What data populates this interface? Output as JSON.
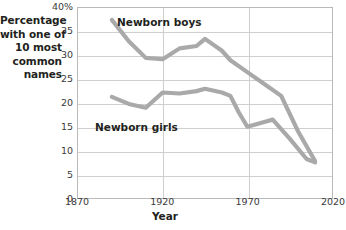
{
  "chart_data": {
    "type": "line",
    "title": "",
    "xlabel": "Year",
    "ylabel": "Percentage with one of 10 most common names",
    "ylabel_lines": [
      "Percentage",
      "with one of",
      "10 most",
      "common",
      "names"
    ],
    "xlim": [
      1870,
      2020
    ],
    "ylim": [
      0,
      40
    ],
    "grid": true,
    "legend_position": "inline-labels",
    "y_ticks": [
      "0",
      "5",
      "10",
      "15",
      "20",
      "25",
      "30",
      "35",
      "40%"
    ],
    "y_tick_values": [
      0,
      5,
      10,
      15,
      20,
      25,
      30,
      35,
      40
    ],
    "x_ticks": [
      "1870",
      "1920",
      "1970",
      "2020"
    ],
    "x_tick_values": [
      1870,
      1920,
      1970,
      2020
    ],
    "series": [
      {
        "name": "Newborn boys",
        "color": "#a9a9a9",
        "x": [
          1890,
          1900,
          1910,
          1920,
          1930,
          1940,
          1945,
          1955,
          1960,
          1970,
          1980,
          1990,
          2000,
          2010
        ],
        "values": [
          37.5,
          33.0,
          29.5,
          29.2,
          31.5,
          32.0,
          33.5,
          31.0,
          29.0,
          26.5,
          24.0,
          21.5,
          14.0,
          7.8
        ]
      },
      {
        "name": "Newborn girls",
        "color": "#a9a9a9",
        "x": [
          1890,
          1900,
          1910,
          1920,
          1930,
          1940,
          1945,
          1955,
          1960,
          1965,
          1970,
          1980,
          1985,
          1995,
          2005,
          2010
        ],
        "values": [
          21.3,
          19.8,
          19.0,
          22.2,
          22.0,
          22.5,
          23.0,
          22.2,
          21.5,
          18.0,
          15.0,
          16.0,
          16.5,
          12.5,
          8.2,
          7.5
        ]
      }
    ]
  },
  "labels": {
    "boys": "Newborn boys",
    "girls": "Newborn girls"
  },
  "colors": {
    "line": "#a9a9a9",
    "grid": "#cfcfcf",
    "frame": "#b9b9b9",
    "text": "#231f20",
    "tick_text": "#3b3b3b"
  }
}
